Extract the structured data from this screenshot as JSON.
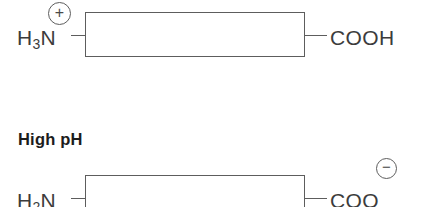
{
  "figure": {
    "background_color": "#ffffff",
    "line_color": "#5d5d5d",
    "text_color": "#3c3c3c",
    "heading_color": "#1c1c1c"
  },
  "structures": [
    {
      "id": "acidic",
      "heading": "",
      "amino_terminus": {
        "formula_main": "H",
        "formula_subscript": "3",
        "formula_tail": "N",
        "charge_symbol": "+",
        "charge_name": "plus-charge"
      },
      "carboxyl_terminus": {
        "formula": "COOH",
        "charge_symbol": "",
        "charge_name": ""
      },
      "chain_box_label": ""
    },
    {
      "id": "basic",
      "heading": "High pH",
      "amino_terminus": {
        "formula_main": "H",
        "formula_subscript": "2",
        "formula_tail": "N",
        "charge_symbol": "",
        "charge_name": ""
      },
      "carboxyl_terminus": {
        "formula": "COO",
        "charge_symbol": "−",
        "charge_name": "minus-charge"
      },
      "chain_box_label": ""
    }
  ]
}
